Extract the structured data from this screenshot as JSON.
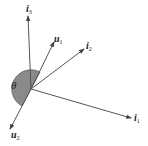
{
  "diagram": {
    "type": "vector-diagram",
    "colors": {
      "line": "#555555",
      "shade": "#8a8a8a",
      "text": "#222222"
    },
    "angle_label": "θ",
    "vectors": [
      {
        "id": "i1",
        "base": "i",
        "sub": "1"
      },
      {
        "id": "i2",
        "base": "i",
        "sub": "2"
      },
      {
        "id": "i3",
        "base": "i",
        "sub": "3"
      },
      {
        "id": "u1",
        "base": "u",
        "sub": "1"
      },
      {
        "id": "u2",
        "base": "u",
        "sub": "2"
      }
    ]
  }
}
